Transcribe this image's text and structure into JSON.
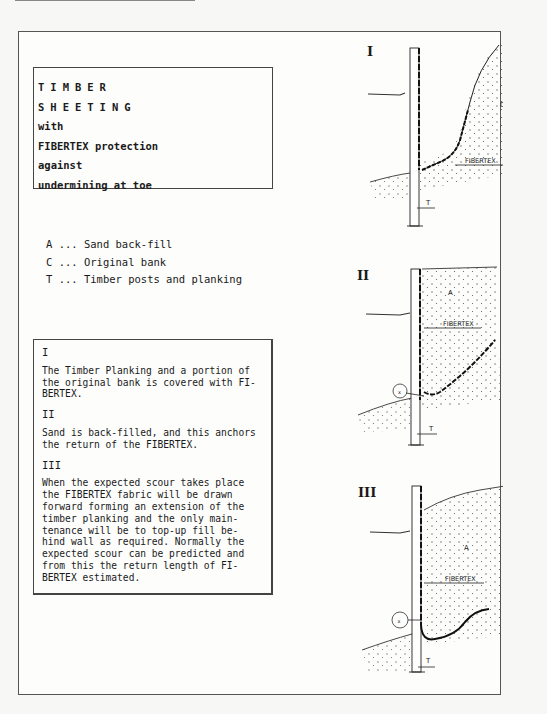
{
  "title_box": {
    "lines": [
      "TIMBER",
      "SHEETING",
      "with",
      "FIBERTEX protection",
      "against",
      "undermining at toe"
    ]
  },
  "legend": {
    "items": [
      {
        "key": "A",
        "label": "A ... Sand back-fill"
      },
      {
        "key": "C",
        "label": "C ... Original bank"
      },
      {
        "key": "T",
        "label": "T ... Timber posts and planking"
      }
    ]
  },
  "steps": [
    {
      "numeral": "I",
      "text": "The Timber Planking and a portion of\nthe original bank is covered with FI-\nBERTEX."
    },
    {
      "numeral": "II",
      "text": "Sand is back-filled, and this anchors\nthe return of the FIBERTEX."
    },
    {
      "numeral": "III",
      "text": "When the expected scour takes place\nthe FIBERTEX fabric will be drawn\nforward forming an extension of the\ntimber planking and the only main-\ntenance will be to top-up fill be-\nhind wall as required. Normally the\nexpected scour can be predicted and\nfrom this the return length of FI-\nBERTEX estimated."
    }
  ],
  "diagrams": [
    {
      "numeral": "I",
      "labels": {
        "fabric": "FIBERTEX",
        "bank": "C",
        "timber": "T"
      }
    },
    {
      "numeral": "II",
      "labels": {
        "fabric": "FIBERTEX",
        "fill": "A",
        "timber": "T",
        "detail": "x"
      }
    },
    {
      "numeral": "III",
      "labels": {
        "fabric": "FIBERTEX",
        "fill": "A",
        "timber": "T",
        "detail": "x"
      }
    }
  ]
}
